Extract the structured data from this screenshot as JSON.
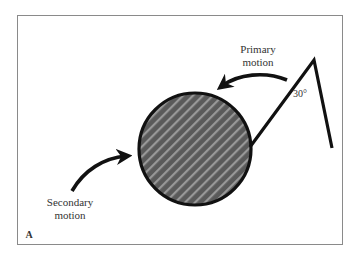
{
  "figure": {
    "panel_label": "A",
    "labels": {
      "primary_line1": "Primary",
      "primary_line2": "motion",
      "secondary_line1": "Secondary",
      "secondary_line2": "motion",
      "angle": "30°"
    },
    "colors": {
      "frame": "#8a8a8a",
      "stroke": "#111111",
      "ball_fill": "#5a5a5a",
      "ball_stripe": "#a8a8a8",
      "text": "#333333"
    }
  }
}
